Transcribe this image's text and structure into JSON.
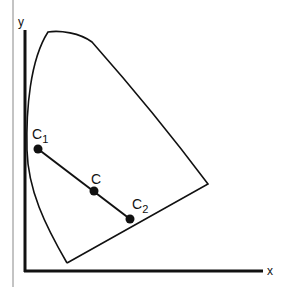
{
  "diagram": {
    "axes": {
      "x_label": "x",
      "y_label": "y"
    },
    "points": [
      {
        "id": "C1",
        "label": "C",
        "subscript": "1",
        "cx": 38,
        "cy": 149
      },
      {
        "id": "C",
        "label": "C",
        "subscript": "",
        "cx": 94,
        "cy": 191
      },
      {
        "id": "C2",
        "label": "C",
        "subscript": "2",
        "cx": 130,
        "cy": 219
      }
    ],
    "colors": {
      "stroke": "#111111",
      "border": "#888888",
      "background": "#ffffff"
    }
  }
}
